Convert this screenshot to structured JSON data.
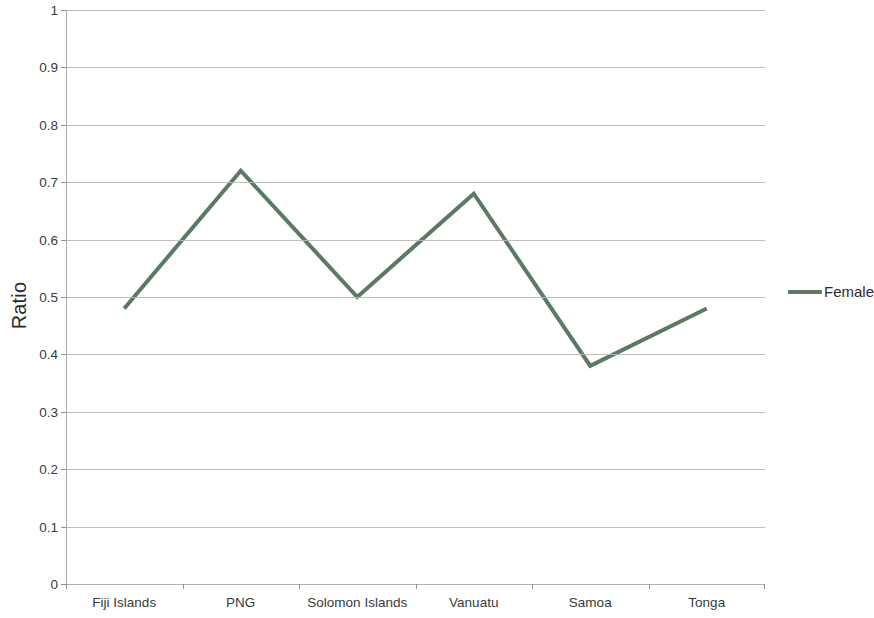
{
  "chart_data": {
    "type": "line",
    "title": "",
    "subtitle": "",
    "xlabel": "",
    "ylabel": "Ratio",
    "categories": [
      "Fiji Islands",
      "PNG",
      "Solomon Islands",
      "Vanuatu",
      "Samoa",
      "Tonga"
    ],
    "series": [
      {
        "name": "Female",
        "color": "#5c7a63",
        "values": [
          0.48,
          0.72,
          0.5,
          0.68,
          0.38,
          0.48
        ]
      }
    ],
    "ylim": [
      0,
      1
    ],
    "ytick_labels": [
      "1",
      "0.9",
      "0.8",
      "0.7",
      "0.6",
      "0.5",
      "0.4",
      "0.3",
      "0.2",
      "0.1",
      "0"
    ],
    "ytick_values": [
      1,
      0.9,
      0.8,
      0.7,
      0.6,
      0.5,
      0.4,
      0.3,
      0.2,
      0.1,
      0
    ],
    "grid": true,
    "grid_orientation": "horizontal",
    "legend_position": "right",
    "legend_entries": [
      "Female"
    ],
    "background_color": "#ffffff",
    "gridline_color": "#b9b9b9",
    "axis_color": "#a8a8a8",
    "text_color": "#3a3a3a",
    "line_width": 4
  }
}
